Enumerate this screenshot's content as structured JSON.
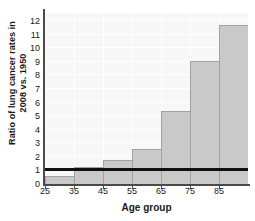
{
  "chart_data": {
    "type": "bar",
    "title": "",
    "xlabel": "Age group",
    "ylabel": "Ratio of lung cancer rates in 2008 vs. 1950",
    "ylabel_line1": "Ratio of lung cancer rates in",
    "ylabel_line2": "2008 vs. 1950",
    "categories": [
      "25",
      "35",
      "45",
      "55",
      "65",
      "75",
      "85"
    ],
    "bin_starts": [
      25,
      35,
      45,
      55,
      65,
      75,
      85
    ],
    "bin_width": 10,
    "values": [
      0.6,
      1.25,
      1.8,
      2.6,
      5.4,
      9.05,
      11.7
    ],
    "xlim": [
      25,
      95
    ],
    "ylim": [
      0,
      12.6
    ],
    "xticks": [
      "25",
      "35",
      "45",
      "55",
      "65",
      "75",
      "85"
    ],
    "yticks": [
      "0",
      "1",
      "2",
      "3",
      "4",
      "5",
      "6",
      "7",
      "8",
      "9",
      "10",
      "11",
      "12"
    ],
    "reference_line": 1,
    "grid": true,
    "legend": "none",
    "colors": {
      "bar_fill": "#c9c9c9",
      "bar_edge": "#a2a2a2",
      "panel_background": "#f7f7f7",
      "gridline": "#ffffff",
      "axis": "#4a4a4a",
      "reference_line": "#101010",
      "text": "#1a1a1a"
    }
  }
}
